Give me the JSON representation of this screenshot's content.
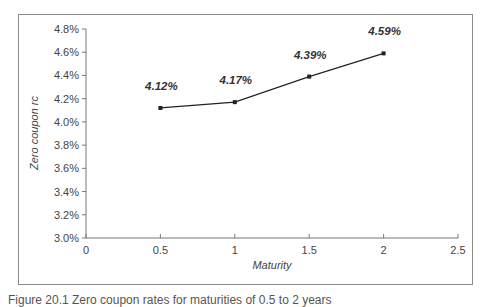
{
  "chart_data": {
    "type": "line",
    "title": "",
    "xlabel": "Maturity",
    "ylabel": "Zero coupon rc",
    "x": [
      0.5,
      1,
      1.5,
      2
    ],
    "values": [
      4.12,
      4.17,
      4.39,
      4.59
    ],
    "data_labels": [
      "4.12%",
      "4.17%",
      "4.39%",
      "4.59%"
    ],
    "xlim": [
      0,
      2.5
    ],
    "ylim": [
      3.0,
      4.8
    ],
    "x_ticks": [
      "0",
      "0.5",
      "1",
      "1.5",
      "2",
      "2.5"
    ],
    "y_ticks": [
      "3.0%",
      "3.2%",
      "3.4%",
      "3.6%",
      "3.8%",
      "4.0%",
      "4.2%",
      "4.4%",
      "4.6%",
      "4.8%"
    ],
    "grid": false,
    "legend": null,
    "line_color": "#222222"
  },
  "caption": "Figure 20.1  Zero coupon rates for maturities of 0.5 to 2 years"
}
